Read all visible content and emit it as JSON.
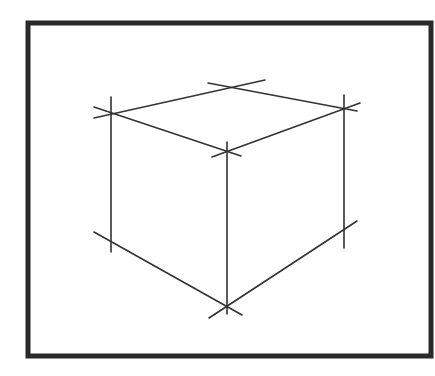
{
  "diagram": {
    "frame": {
      "x": 28,
      "y": 23,
      "width": 403,
      "height": 333,
      "stroke": "#2a2a2a",
      "stroke_width": 5
    },
    "line_color": "#333333",
    "line_width": 1.6,
    "vertices": {
      "top_left": [
        111,
        114
      ],
      "top_back": [
        227,
        88
      ],
      "top_right": [
        344,
        108
      ],
      "top_front": [
        227,
        151
      ],
      "bottom_left": [
        111,
        243
      ],
      "bottom_front": [
        227,
        306
      ],
      "bottom_right": [
        344,
        229
      ]
    },
    "lines": [
      {
        "name": "top-left-to-back-edge",
        "x1": 94,
        "y1": 118,
        "x2": 265,
        "y2": 80
      },
      {
        "name": "top-back-to-right-edge",
        "x1": 208,
        "y1": 83,
        "x2": 357,
        "y2": 111
      },
      {
        "name": "top-left-to-front-edge",
        "x1": 94,
        "y1": 107,
        "x2": 241,
        "y2": 156
      },
      {
        "name": "top-front-to-right-edge",
        "x1": 212,
        "y1": 157,
        "x2": 360,
        "y2": 103
      },
      {
        "name": "left-vertical-edge",
        "x1": 111,
        "y1": 97,
        "x2": 111,
        "y2": 252
      },
      {
        "name": "front-vertical-edge",
        "x1": 227,
        "y1": 142,
        "x2": 227,
        "y2": 314
      },
      {
        "name": "right-vertical-edge",
        "x1": 344,
        "y1": 95,
        "x2": 344,
        "y2": 248
      },
      {
        "name": "bottom-left-to-front-edge",
        "x1": 94,
        "y1": 232,
        "x2": 242,
        "y2": 315
      },
      {
        "name": "bottom-front-to-right-edge",
        "x1": 209,
        "y1": 318,
        "x2": 357,
        "y2": 221
      }
    ]
  }
}
